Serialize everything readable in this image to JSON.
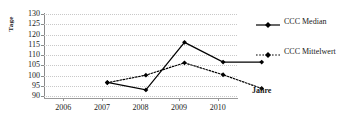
{
  "chart_data": {
    "type": "line",
    "title": "",
    "xlabel": "Jahre",
    "ylabel": "Tage",
    "categories": [
      "2006",
      "2007",
      "2008",
      "2009",
      "2010"
    ],
    "ylim": [
      90,
      130
    ],
    "yticks": [
      90,
      95,
      100,
      105,
      110,
      115,
      120,
      125,
      130
    ],
    "grid": true,
    "legend_position": "right",
    "series": [
      {
        "name": "CCC Median",
        "values": [
          103.5,
          99.8,
          123.0,
          113.4,
          113.4
        ],
        "linestyle": "solid",
        "marker": "diamond",
        "color": "#000000"
      },
      {
        "name": "CCC Mittelwert",
        "values": [
          103.3,
          107.0,
          113.0,
          107.2,
          100.5
        ],
        "linestyle": "dotted",
        "marker": "diamond",
        "color": "#000000"
      }
    ]
  },
  "axes": {
    "y_title": "Tage",
    "x_title": "Jahre",
    "y_tick_labels": [
      "130",
      "125",
      "120",
      "115",
      "110",
      "105",
      "100",
      "95",
      "90"
    ],
    "x_tick_labels": [
      "2006",
      "2007",
      "2008",
      "2009",
      "2010"
    ]
  },
  "legend": {
    "items": [
      {
        "label": "CCC Median",
        "style": "solid-diamond"
      },
      {
        "label": "CCC Mittelwert",
        "style": "dotted-diamond"
      }
    ]
  },
  "colors": {
    "series": "#000000",
    "gridline": "#c8c8c8",
    "axis": "#8a8a8a",
    "background": "#ffffff"
  }
}
